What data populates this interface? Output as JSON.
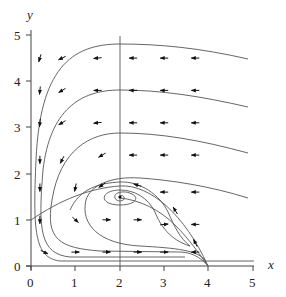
{
  "figure": {
    "type": "phase_portrait",
    "x_axis": {
      "label": "x",
      "ticks": [
        "0",
        "1",
        "2",
        "3",
        "4",
        "5"
      ],
      "range": [
        0,
        5
      ]
    },
    "y_axis": {
      "label": "y",
      "ticks": [
        "0",
        "1",
        "2",
        "3",
        "4",
        "5"
      ],
      "range": [
        0,
        5
      ]
    },
    "equilibrium": {
      "x": 2,
      "y": 1.5,
      "kind": "stable spiral"
    },
    "nullclines": {
      "vertical_line": {
        "x": 2
      },
      "curve_from_y_axis": {
        "start": [
          0,
          1
        ],
        "end": [
          4,
          0
        ],
        "description": "parabola-like curve from (0,1) rising through (2,1.5) to (4,0)"
      }
    },
    "colors": {
      "line": "#555555",
      "arrow": "#111111",
      "axis": "#444444",
      "text": "#222222"
    },
    "arrows": [
      {
        "x": 0.2,
        "y": 4.5,
        "dx": -0.3,
        "dy": -1
      },
      {
        "x": 0.7,
        "y": 4.5,
        "dx": -1,
        "dy": -0.5
      },
      {
        "x": 1.5,
        "y": 4.5,
        "dx": -1,
        "dy": -0.1
      },
      {
        "x": 2.3,
        "y": 4.5,
        "dx": -1,
        "dy": 0
      },
      {
        "x": 3.0,
        "y": 4.5,
        "dx": -1,
        "dy": 0
      },
      {
        "x": 3.7,
        "y": 4.5,
        "dx": -1,
        "dy": 0
      },
      {
        "x": 0.2,
        "y": 3.8,
        "dx": -0.1,
        "dy": -1
      },
      {
        "x": 0.7,
        "y": 3.8,
        "dx": -1,
        "dy": -0.6
      },
      {
        "x": 1.5,
        "y": 3.8,
        "dx": -1,
        "dy": 0
      },
      {
        "x": 2.3,
        "y": 3.8,
        "dx": -1,
        "dy": 0
      },
      {
        "x": 3.0,
        "y": 3.8,
        "dx": -1,
        "dy": 0
      },
      {
        "x": 3.7,
        "y": 3.8,
        "dx": -1,
        "dy": 0
      },
      {
        "x": 0.2,
        "y": 3.1,
        "dx": -0.1,
        "dy": -1
      },
      {
        "x": 0.7,
        "y": 3.1,
        "dx": -1,
        "dy": -0.6
      },
      {
        "x": 1.5,
        "y": 3.1,
        "dx": -1,
        "dy": -0.1
      },
      {
        "x": 2.3,
        "y": 3.1,
        "dx": -1,
        "dy": 0
      },
      {
        "x": 3.0,
        "y": 3.1,
        "dx": -1,
        "dy": 0
      },
      {
        "x": 3.7,
        "y": 3.1,
        "dx": -1,
        "dy": 0
      },
      {
        "x": 0.2,
        "y": 2.3,
        "dx": 0,
        "dy": -1
      },
      {
        "x": 0.7,
        "y": 2.3,
        "dx": -0.5,
        "dy": -1
      },
      {
        "x": 1.6,
        "y": 2.4,
        "dx": -1,
        "dy": -0.6
      },
      {
        "x": 2.3,
        "y": 2.4,
        "dx": -1,
        "dy": 0
      },
      {
        "x": 3.0,
        "y": 2.4,
        "dx": -1,
        "dy": 0
      },
      {
        "x": 3.7,
        "y": 2.4,
        "dx": -1,
        "dy": 0
      },
      {
        "x": 0.2,
        "y": 1.7,
        "dx": 0,
        "dy": -1
      },
      {
        "x": 1.0,
        "y": 1.7,
        "dx": -0.2,
        "dy": -1
      },
      {
        "x": 1.6,
        "y": 1.75,
        "dx": -1,
        "dy": -0.7
      },
      {
        "x": 2.4,
        "y": 1.75,
        "dx": -1,
        "dy": 0.3
      },
      {
        "x": 3.0,
        "y": 1.6,
        "dx": -1,
        "dy": 0
      },
      {
        "x": 3.7,
        "y": 1.6,
        "dx": -1,
        "dy": 0
      },
      {
        "x": 0.2,
        "y": 1.0,
        "dx": 0,
        "dy": -1
      },
      {
        "x": 1.0,
        "y": 1.0,
        "dx": 0.8,
        "dy": -0.7
      },
      {
        "x": 1.7,
        "y": 1.0,
        "dx": 1,
        "dy": 0
      },
      {
        "x": 2.4,
        "y": 1.0,
        "dx": 1,
        "dy": 0
      },
      {
        "x": 3.0,
        "y": 0.9,
        "dx": 1,
        "dy": 0.1
      },
      {
        "x": 3.7,
        "y": 0.9,
        "dx": -1,
        "dy": 0
      },
      {
        "x": 0.3,
        "y": 0.3,
        "dx": 1,
        "dy": -0.5
      },
      {
        "x": 1.0,
        "y": 0.3,
        "dx": 1,
        "dy": 0
      },
      {
        "x": 1.7,
        "y": 0.3,
        "dx": 1,
        "dy": 0
      },
      {
        "x": 2.4,
        "y": 0.3,
        "dx": 1,
        "dy": 0
      },
      {
        "x": 3.0,
        "y": 0.3,
        "dx": 1,
        "dy": 0
      },
      {
        "x": 3.7,
        "y": 0.3,
        "dx": -1,
        "dy": 0
      },
      {
        "x": 3.25,
        "y": 1.2,
        "dx": -0.6,
        "dy": 1
      },
      {
        "x": 3.7,
        "y": 0.5,
        "dx": -0.5,
        "dy": 1
      }
    ]
  }
}
